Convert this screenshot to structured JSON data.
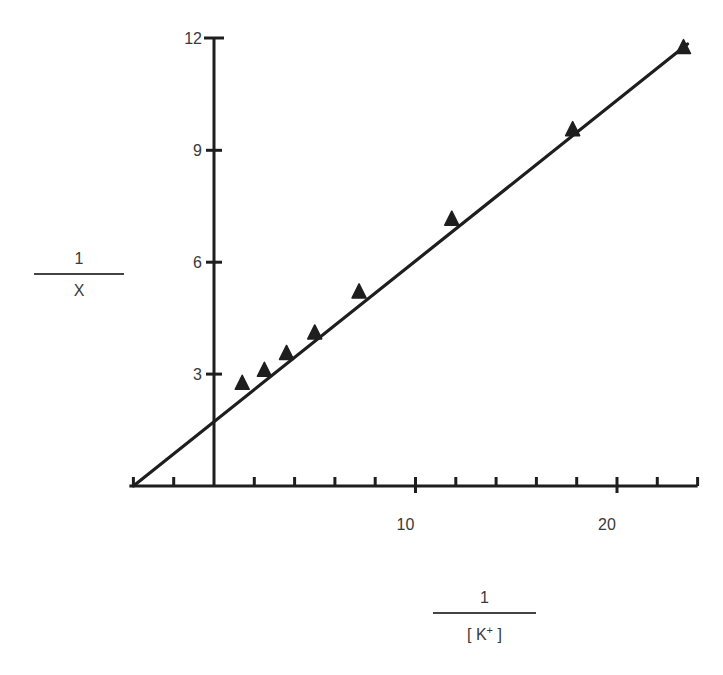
{
  "chart_data": {
    "type": "scatter",
    "title": "",
    "xlabel": "1 / [K+]",
    "ylabel": "1 / X",
    "xlabel_parts": {
      "numerator": "1",
      "denominator_open": "[ K",
      "denominator_sup": "+",
      "denominator_close": " ]"
    },
    "ylabel_parts": {
      "numerator": "1",
      "denominator": "X"
    },
    "xlim": [
      -4.2,
      24
    ],
    "ylim": [
      0,
      12
    ],
    "x_ticks": [
      -4,
      -2,
      0,
      2,
      4,
      6,
      8,
      10,
      12,
      14,
      16,
      18,
      20,
      22,
      24
    ],
    "x_tick_labels": [
      {
        "value": 10,
        "label": "10"
      },
      {
        "value": 20,
        "label": "20"
      }
    ],
    "y_ticks": [
      3,
      6,
      9,
      12
    ],
    "y_tick_labels": [
      {
        "value": 3,
        "label": "3"
      },
      {
        "value": 6,
        "label": "6"
      },
      {
        "value": 9,
        "label": "9"
      },
      {
        "value": 12,
        "label": "12"
      }
    ],
    "grid": false,
    "legend": null,
    "marker": "triangle",
    "series": [
      {
        "name": "data",
        "points": [
          {
            "x": 1.4,
            "y": 2.7
          },
          {
            "x": 2.5,
            "y": 3.05
          },
          {
            "x": 3.6,
            "y": 3.5
          },
          {
            "x": 5.0,
            "y": 4.05
          },
          {
            "x": 7.2,
            "y": 5.15
          },
          {
            "x": 11.8,
            "y": 7.1
          },
          {
            "x": 17.8,
            "y": 9.5
          },
          {
            "x": 23.3,
            "y": 11.7
          }
        ]
      }
    ],
    "fit_line": {
      "x_intercept": -4.0,
      "y_intercept": 1.75,
      "from": {
        "x": -4.0,
        "y": 0
      },
      "to": {
        "x": 23.5,
        "y": 11.85
      }
    }
  }
}
